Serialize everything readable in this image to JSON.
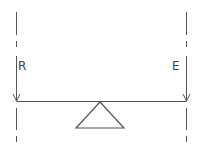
{
  "diagram": {
    "title": "",
    "type": "lever",
    "labels": {
      "left_force": "R",
      "right_force": "E"
    },
    "colors": {
      "stroke": "#555555",
      "background": "#ffffff"
    },
    "elements": {
      "beam": "horizontal lever beam",
      "fulcrum": "triangle pivot under beam center",
      "left_arrow": "downward arrow at left end (R)",
      "right_arrow": "downward arrow at right end (E)",
      "left_axis": "dashed vertical line",
      "right_axis": "dashed vertical line"
    }
  }
}
